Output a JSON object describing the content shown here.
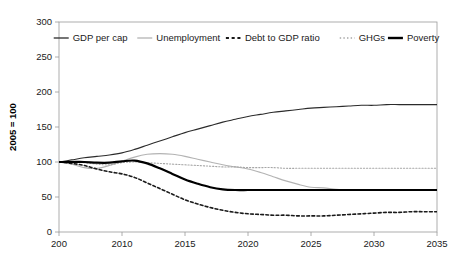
{
  "chart_data": {
    "type": "line",
    "title": "",
    "xlabel": "",
    "ylabel": "2005 = 100",
    "xlim": [
      2005,
      2035
    ],
    "ylim": [
      0,
      300
    ],
    "grid": false,
    "legend_position": "top-inside",
    "xticks": [
      "200",
      "2010",
      "2015",
      "2020",
      "2025",
      "2030",
      "2035"
    ],
    "xtick_values": [
      2005,
      2010,
      2015,
      2020,
      2025,
      2030,
      2035
    ],
    "yticks": [
      "0",
      "50",
      "100",
      "150",
      "200",
      "250",
      "300"
    ],
    "ytick_values": [
      0,
      50,
      100,
      150,
      200,
      250,
      300
    ],
    "x": [
      2005,
      2006,
      2007,
      2008,
      2009,
      2010,
      2011,
      2012,
      2013,
      2014,
      2015,
      2016,
      2017,
      2018,
      2019,
      2020,
      2021,
      2022,
      2023,
      2024,
      2025,
      2026,
      2027,
      2028,
      2029,
      2030,
      2031,
      2032,
      2033,
      2034,
      2035
    ],
    "series": [
      {
        "name": "GDP per cap",
        "style": "solid",
        "color": "#2b2b2b",
        "width": 1.1,
        "values": [
          100,
          103,
          106,
          108,
          110,
          113,
          118,
          124,
          130,
          136,
          142,
          147,
          152,
          157,
          161,
          165,
          168,
          171,
          173,
          175,
          177,
          178,
          179,
          180,
          181,
          181,
          182,
          182,
          182,
          182,
          182
        ]
      },
      {
        "name": "Unemployment",
        "style": "solid",
        "color": "#b3b3b3",
        "width": 1.1,
        "values": [
          100,
          97,
          92,
          91,
          95,
          101,
          107,
          111,
          112,
          111,
          108,
          104,
          100,
          96,
          93,
          90,
          85,
          79,
          73,
          68,
          64,
          63,
          61,
          60,
          60,
          60,
          60,
          60,
          60,
          60,
          60
        ]
      },
      {
        "name": "Debt to GDP ratio",
        "style": "dashed",
        "color": "#1a1a1a",
        "width": 1.6,
        "values": [
          100,
          98,
          95,
          90,
          86,
          83,
          78,
          70,
          62,
          54,
          46,
          40,
          35,
          31,
          28,
          26,
          25,
          24,
          24,
          23,
          23,
          23,
          24,
          25,
          26,
          27,
          28,
          28,
          29,
          29,
          29
        ]
      },
      {
        "name": "GHGs",
        "style": "dotted",
        "color": "#a6a6a6",
        "width": 1.1,
        "values": [
          100,
          100,
          99,
          97,
          96,
          99,
          100,
          99,
          98,
          97,
          96,
          95,
          94,
          93,
          93,
          92,
          92,
          92,
          91,
          91,
          91,
          91,
          91,
          91,
          91,
          91,
          91,
          91,
          91,
          91,
          91
        ]
      },
      {
        "name": "Poverty",
        "style": "solid",
        "color": "#000000",
        "width": 2.2,
        "values": [
          100,
          100,
          100,
          99,
          99,
          101,
          102,
          98,
          91,
          83,
          75,
          69,
          64,
          61,
          60,
          60,
          60,
          60,
          60,
          60,
          60,
          60,
          60,
          60,
          60,
          60,
          60,
          60,
          60,
          60,
          60
        ]
      }
    ],
    "legend": [
      {
        "label": "GDP per cap",
        "style": "solid",
        "color": "#2b2b2b",
        "width": 1.3
      },
      {
        "label": "Unemployment",
        "style": "solid",
        "color": "#b3b3b3",
        "width": 1.3
      },
      {
        "label": "Debt to GDP ratio",
        "style": "dashed",
        "color": "#1a1a1a",
        "width": 1.8
      },
      {
        "label": "GHGs",
        "style": "dotted",
        "color": "#a6a6a6",
        "width": 1.3
      },
      {
        "label": "Poverty",
        "style": "solid",
        "color": "#000000",
        "width": 2.4
      }
    ]
  }
}
